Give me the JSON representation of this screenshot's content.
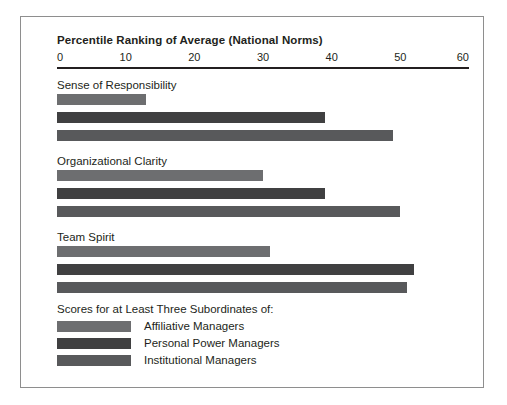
{
  "chart_data": {
    "type": "bar",
    "orientation": "horizontal",
    "title": "Percentile Ranking of Average (National Norms)",
    "xlabel": "",
    "ylabel": "",
    "xlim": [
      0,
      60
    ],
    "grid": false,
    "legend_position": "bottom",
    "legend_title": "Scores for at Least Three Subordinates of:",
    "axis_ticks": [
      0,
      10,
      20,
      30,
      40,
      50,
      60
    ],
    "axis_tick_labels": [
      "0",
      "10",
      "20",
      "30",
      "40",
      "50",
      "60"
    ],
    "categories": [
      "Sense of Responsibility",
      "Organizational Clarity",
      "Team Spirit"
    ],
    "series": [
      {
        "name": "Affiliative Managers",
        "color": "#6d6e70",
        "values": [
          13,
          30,
          31
        ]
      },
      {
        "name": "Personal Power Managers",
        "color": "#404041",
        "values": [
          39,
          39,
          52
        ]
      },
      {
        "name": "Institutional Managers",
        "color": "#58595b",
        "values": [
          49,
          50,
          51
        ]
      }
    ]
  },
  "colors": {
    "frame_border": "#8e8e8e",
    "axis_rule": "#231f20",
    "text": "#231f20",
    "background": "#ffffff"
  }
}
